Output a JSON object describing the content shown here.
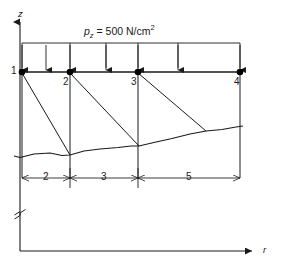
{
  "figure": {
    "type": "engineering-diagram",
    "axes": {
      "vertical": {
        "name": "z-axis",
        "label": "z"
      },
      "horizontal": {
        "name": "r-axis",
        "label": "r"
      }
    },
    "load": {
      "name": "distributed-load",
      "symbol": "p",
      "subscript": "z",
      "equals": "=",
      "value": "500",
      "unit": "N/cm",
      "unit_exponent": "2",
      "full_text": "pz = 500 N/cm2",
      "arrow_count": 7,
      "direction": "down"
    },
    "nodes": [
      {
        "id": "node-1",
        "label": "1",
        "x": 22,
        "y": 72
      },
      {
        "id": "node-2",
        "label": "2",
        "x": 70,
        "y": 72
      },
      {
        "id": "node-3",
        "label": "3",
        "x": 138,
        "y": 72
      },
      {
        "id": "node-4",
        "label": "4",
        "x": 240,
        "y": 72
      }
    ],
    "dimensions": [
      {
        "name": "dimension-segment-1",
        "label": "2",
        "from": 22,
        "to": 70
      },
      {
        "name": "dimension-segment-2",
        "label": "3",
        "from": 70,
        "to": 138
      },
      {
        "name": "dimension-segment-3",
        "label": "5",
        "from": 138,
        "to": 240
      }
    ],
    "colors": {
      "line": "#1a1a1a",
      "background": "#ffffff",
      "node_fill": "#000000"
    }
  }
}
